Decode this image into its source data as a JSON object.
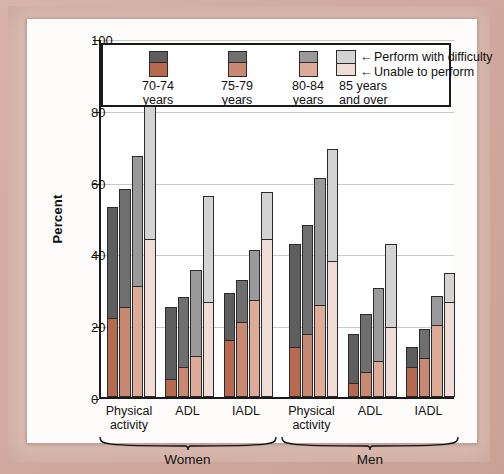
{
  "chart_data": {
    "type": "bar",
    "subtype": "stacked-grouped",
    "title": "",
    "xlabel": "",
    "ylabel": "Percent",
    "ylim": [
      0,
      100
    ],
    "yticks": [
      0,
      20,
      40,
      60,
      80,
      100
    ],
    "grid": true,
    "legend_position": "top-inside",
    "series": [
      {
        "name": "Unable to perform",
        "color": "#b5694f"
      },
      {
        "name": "Perform with difficulty",
        "color": "#5e5e5e"
      }
    ],
    "age_groups": [
      {
        "label": "70-74\nyears",
        "top_color": "#5e5e5e",
        "bottom_color": "#b5694f"
      },
      {
        "label": "75-79\nyears",
        "top_color": "#6f6f6f",
        "bottom_color": "#c98871"
      },
      {
        "label": "80-84\nyears",
        "top_color": "#9a9a9a",
        "bottom_color": "#ddab97"
      },
      {
        "label": "85 years\nand over",
        "top_color": "#d3d3d3",
        "bottom_color": "#f0dcd6"
      }
    ],
    "sex_groups": [
      "Women",
      "Men"
    ],
    "categories": [
      "Physical\nactivity",
      "ADL",
      "IADL"
    ],
    "groups": [
      {
        "sex": "Women",
        "category": "Physical\nactivity",
        "bars": [
          {
            "age": "70-74 years",
            "unable": 22,
            "difficulty": 31,
            "total": 53
          },
          {
            "age": "75-79 years",
            "unable": 25,
            "difficulty": 33,
            "total": 58
          },
          {
            "age": "80-84 years",
            "unable": 31,
            "difficulty": 36,
            "total": 67
          },
          {
            "age": "85 years and over",
            "unable": 44,
            "difficulty": 37,
            "total": 81
          }
        ]
      },
      {
        "sex": "Women",
        "category": "ADL",
        "bars": [
          {
            "age": "70-74 years",
            "unable": 5,
            "difficulty": 20,
            "total": 25
          },
          {
            "age": "75-79 years",
            "unable": 8.5,
            "difficulty": 19.5,
            "total": 28
          },
          {
            "age": "80-84 years",
            "unable": 11.5,
            "difficulty": 24,
            "total": 35.5
          },
          {
            "age": "85 years and over",
            "unable": 26.5,
            "difficulty": 29.5,
            "total": 56
          }
        ]
      },
      {
        "sex": "Women",
        "category": "IADL",
        "bars": [
          {
            "age": "70-74 years",
            "unable": 16,
            "difficulty": 13,
            "total": 29
          },
          {
            "age": "75-79 years",
            "unable": 21,
            "difficulty": 11.5,
            "total": 32.5
          },
          {
            "age": "80-84 years",
            "unable": 27,
            "difficulty": 14,
            "total": 41
          },
          {
            "age": "85 years and over",
            "unable": 44,
            "difficulty": 13,
            "total": 57
          }
        ]
      },
      {
        "sex": "Men",
        "category": "Physical\nactivity",
        "bars": [
          {
            "age": "70-74 years",
            "unable": 14,
            "difficulty": 28.5,
            "total": 42.5
          },
          {
            "age": "75-79 years",
            "unable": 17.5,
            "difficulty": 30.5,
            "total": 48
          },
          {
            "age": "80-84 years",
            "unable": 25.5,
            "difficulty": 35.5,
            "total": 61
          },
          {
            "age": "85 years and over",
            "unable": 38,
            "difficulty": 31,
            "total": 69
          }
        ]
      },
      {
        "sex": "Men",
        "category": "ADL",
        "bars": [
          {
            "age": "70-74 years",
            "unable": 4,
            "difficulty": 13.5,
            "total": 17.5
          },
          {
            "age": "75-79 years",
            "unable": 7,
            "difficulty": 16,
            "total": 23
          },
          {
            "age": "80-84 years",
            "unable": 10,
            "difficulty": 20.5,
            "total": 30.5
          },
          {
            "age": "85 years and over",
            "unable": 19.5,
            "difficulty": 23,
            "total": 42.5
          }
        ]
      },
      {
        "sex": "Men",
        "category": "IADL",
        "bars": [
          {
            "age": "70-74 years",
            "unable": 8.5,
            "difficulty": 5.5,
            "total": 14
          },
          {
            "age": "75-79 years",
            "unable": 11,
            "difficulty": 8,
            "total": 19
          },
          {
            "age": "80-84 years",
            "unable": 20,
            "difficulty": 8,
            "total": 28
          },
          {
            "age": "85 years and over",
            "unable": 26.5,
            "difficulty": 8,
            "total": 34.5
          }
        ]
      }
    ]
  },
  "axis": {
    "ylabel": "Percent",
    "yticks": [
      "0",
      "20",
      "40",
      "60",
      "80",
      "100"
    ]
  },
  "legend": {
    "items": [
      {
        "label": "70-74\nyears"
      },
      {
        "label": "75-79\nyears"
      },
      {
        "label": "80-84\nyears"
      },
      {
        "label": "85 years\nand over"
      }
    ],
    "keys": [
      {
        "arrow": "←",
        "label": "Perform with difficulty"
      },
      {
        "arrow": "←",
        "label": "Unable to perform"
      }
    ]
  },
  "xaxis": {
    "categories": [
      "Physical\nactivity",
      "ADL",
      "IADL",
      "Physical\nactivity",
      "ADL",
      "IADL"
    ],
    "groups": [
      "Women",
      "Men"
    ]
  }
}
